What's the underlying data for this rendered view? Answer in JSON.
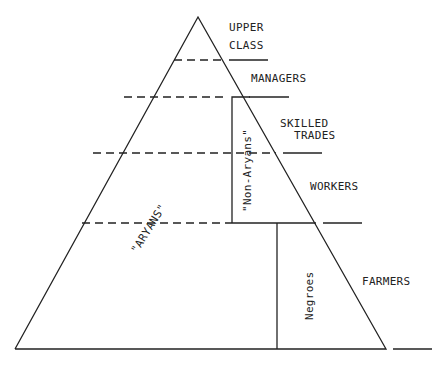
{
  "diagram": {
    "type": "social hierarchy pyramid",
    "strata": [
      {
        "label_lines": [
          "UPPER",
          "CLASS"
        ]
      },
      {
        "label_lines": [
          "MANAGERS"
        ]
      },
      {
        "label_lines": [
          "SKILLED",
          "TRADES"
        ]
      },
      {
        "label_lines": [
          "WORKERS"
        ]
      },
      {
        "label_lines": [
          "FARMERS"
        ]
      }
    ],
    "groups": {
      "aryans": "\"ARYANS\"",
      "non_aryans": "\"Non-Aryans\"",
      "negroes": "Negroes"
    },
    "colors": {
      "line": "#222222",
      "background": "#ffffff"
    }
  }
}
